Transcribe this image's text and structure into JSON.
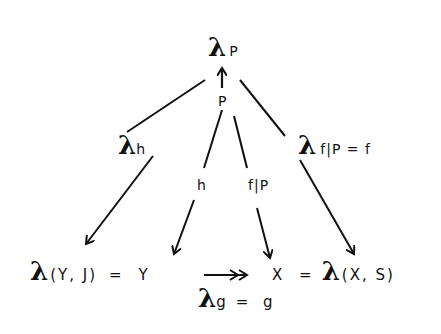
{
  "diagram": {
    "nodes": {
      "top": {
        "lambda": "λ",
        "sub": "P"
      },
      "p": {
        "label": "P"
      },
      "lambda_h": {
        "lambda": "λ",
        "sub": "h"
      },
      "lambda_fp": {
        "lambda": "λ",
        "sub": "f|P = f"
      },
      "h": {
        "label": "h"
      },
      "fp": {
        "label": "f|P"
      },
      "bottom_left": {
        "lambda": "λ",
        "args": "(Y, J)",
        "rest": "= Y"
      },
      "bottom_right": {
        "lead": "X =",
        "lambda": "λ",
        "args": "(X, S)"
      },
      "lambda_g": {
        "lambda": "λ",
        "sub": "g",
        "rest": "= g"
      }
    },
    "edges": [
      {
        "from": "P",
        "to": "λP",
        "style": "arrow-up"
      },
      {
        "from": "λP",
        "to": "λh",
        "style": "line"
      },
      {
        "from": "λh",
        "to": "λ(Y,J)",
        "style": "arrow"
      },
      {
        "from": "P",
        "to": "h",
        "style": "line"
      },
      {
        "from": "h",
        "to": "Y",
        "style": "arrow"
      },
      {
        "from": "P",
        "to": "f|P",
        "style": "line"
      },
      {
        "from": "f|P",
        "to": "X",
        "style": "arrow"
      },
      {
        "from": "λP",
        "to": "λf|P",
        "style": "line"
      },
      {
        "from": "λf|P",
        "to": "λ(X,S)",
        "style": "arrow"
      },
      {
        "from": "Y",
        "to": "X",
        "style": "double-head-arrow",
        "label": "λg = g"
      }
    ]
  }
}
